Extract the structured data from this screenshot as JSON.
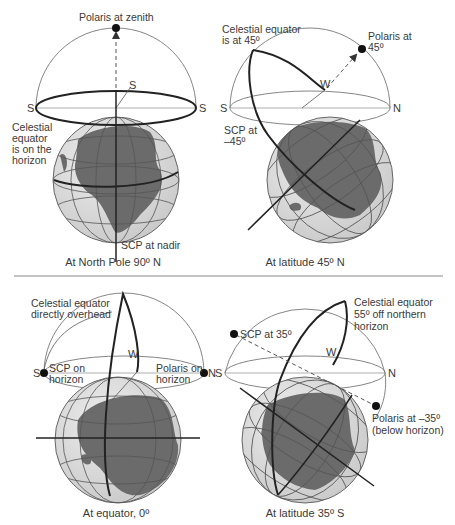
{
  "panels": [
    {
      "id": "north-pole",
      "caption": "At North Pole 90º N",
      "labels": {
        "top": "Polaris at zenith",
        "left_1": "Celestial",
        "left_2": "equator",
        "left_3": "is on the",
        "left_4": "horizon",
        "bottom": "SCP at nadir"
      },
      "directions": {
        "left": "S",
        "right": "S",
        "back": "S"
      }
    },
    {
      "id": "latitude-45n",
      "caption": "At latitude 45º N",
      "labels": {
        "top_1": "Celestial equator",
        "top_2": "is at 45º",
        "right_1": "Polaris at",
        "right_2": "45º",
        "left_1": "SCP at",
        "left_2": "–45º"
      },
      "directions": {
        "left": "S",
        "right": "N",
        "back": "W"
      }
    },
    {
      "id": "equator",
      "caption": "At equator, 0º",
      "labels": {
        "top_1": "Celestial equator",
        "top_2": "directly overhead",
        "left_1": "SCP on",
        "left_2": "horizon",
        "right_1": "Polaris on",
        "right_2": "horizon"
      },
      "directions": {
        "left": "S",
        "right": "N",
        "back": "W"
      }
    },
    {
      "id": "latitude-35s",
      "caption": "At latitude 35º S",
      "labels": {
        "top_1": "Celestial equator",
        "top_2": "55º off northern",
        "top_3": "horizon",
        "left": "SCP at 35º",
        "right_1": "Polaris at –35º",
        "right_2": "(below horizon)"
      },
      "directions": {
        "left": "S",
        "right": "N",
        "back": "W"
      }
    }
  ],
  "colors": {
    "land": "#6b6b6b",
    "ocean": "#dcdcdc",
    "grid": "#555555",
    "line": "#222222",
    "thin": "#777777",
    "divider": "#888888"
  }
}
